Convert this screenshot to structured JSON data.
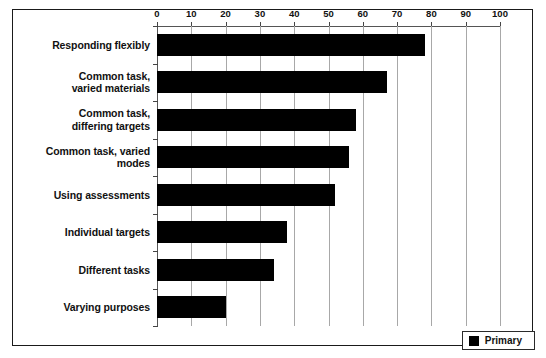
{
  "chart_data": {
    "type": "bar",
    "orientation": "horizontal",
    "title": "",
    "subtitle": "",
    "xlabel": "",
    "ylabel": "",
    "xlim": [
      0,
      100
    ],
    "xticks": [
      0,
      10,
      20,
      30,
      40,
      50,
      60,
      70,
      80,
      90,
      100
    ],
    "xtick_labels": [
      "0",
      "10",
      "20",
      "30",
      "40",
      "50",
      "60",
      "70",
      "80",
      "90",
      "100"
    ],
    "grid": true,
    "grid_axis": "x",
    "axis_position": "top",
    "legend_position": "bottom-right",
    "categories": [
      "Responding flexibly",
      "Common task,\nvaried materials",
      "Common task,\ndiffering targets",
      "Common task, varied modes",
      "Using assessments",
      "Individual targets",
      "Different tasks",
      "Varying purposes"
    ],
    "series": [
      {
        "name": "Primary",
        "color": "#000000",
        "values": [
          78,
          67,
          58,
          56,
          52,
          38,
          34,
          20
        ]
      }
    ]
  },
  "legend": {
    "entries": [
      {
        "label": "Primary",
        "swatch_color": "#000000"
      }
    ]
  },
  "colors": {
    "bar": "#000000",
    "frame": "#1a1a1a",
    "gridline": "#a8a8a8",
    "axis": "#555555",
    "text": "#111111",
    "background": "#ffffff"
  }
}
